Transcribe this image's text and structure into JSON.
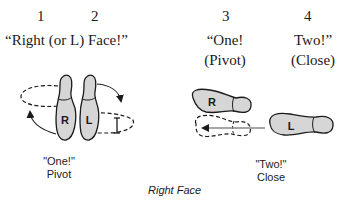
{
  "counts": {
    "c1": "1",
    "c2": "2",
    "c3": "3",
    "c4": "4"
  },
  "commands": {
    "right_face": "“Right (or L) Face!”",
    "one_line1": "“One!",
    "one_line2": "(Pivot)",
    "two_line1": "Two!”",
    "two_line2": "(Close)"
  },
  "figures": {
    "pivot": {
      "right_foot_label": "R",
      "left_foot_label": "L",
      "caption_line1": "\"One!\"",
      "caption_line2": "Pivot"
    },
    "close": {
      "right_foot_label": "R",
      "left_foot_label": "L",
      "caption_line1": "\"Two!\"",
      "caption_line2": "Close"
    }
  },
  "title": "Right Face",
  "colors": {
    "foot_fill": "#d6d6d6",
    "outline": "#1a1a1a",
    "arrow_gray": "#888888"
  }
}
